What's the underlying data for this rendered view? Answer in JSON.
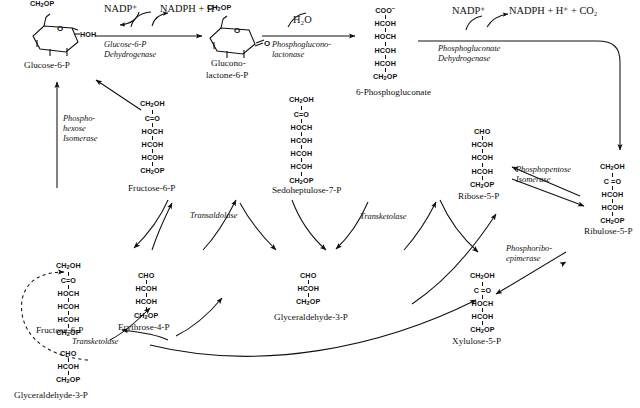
{
  "diagram": {
    "type": "biochemical-pathway"
  },
  "metabolites": [
    {
      "id": "glucose-6-p",
      "name": "Glucose-6-P",
      "form": "ring",
      "labels": [
        "CH2OP",
        "O",
        "HOH"
      ]
    },
    {
      "id": "glucono-lactone-6-p",
      "name_line1": "Glucono-",
      "name_line2": "lactone-6-P",
      "form": "ring",
      "labels": [
        "CH2OP",
        "O",
        "O"
      ]
    },
    {
      "id": "6-phosphogluconate",
      "name": "6-Phosphogluconate",
      "form": "chain",
      "rows": [
        "COO⁻",
        "HCOH",
        "HOCH",
        "HCOH",
        "HCOH",
        "CH2OP"
      ]
    },
    {
      "id": "fructose-6-p-top",
      "name": "Fructose-6-P",
      "form": "chain",
      "rows": [
        "CH2OH",
        "C=O",
        "HOCH",
        "HCOH",
        "HCOH",
        "CH2OP"
      ]
    },
    {
      "id": "sedoheptulose-7-p",
      "name": "Sedoheptulose-7-P",
      "form": "chain",
      "rows": [
        "CH2OH",
        "C=O",
        "HOCH",
        "HCOH",
        "HCOH",
        "HCOH",
        "CH2OP"
      ]
    },
    {
      "id": "ribose-5-p",
      "name": "Ribose-5-P",
      "form": "chain",
      "rows": [
        "CHO",
        "HCOH",
        "HCOH",
        "HCOH",
        "CH2OP"
      ]
    },
    {
      "id": "ribulose-5-p",
      "name": "Ribulose-5-P",
      "form": "chain",
      "rows": [
        "CH2OH",
        "C =O",
        "HCOH",
        "HCOH",
        "CH2OP"
      ]
    },
    {
      "id": "fructose-6-p-bottom",
      "name": "Fructose-6-P",
      "form": "chain",
      "rows": [
        "CH2OH",
        "C=O",
        "HOCH",
        "HCOH",
        "HCOH",
        "CH2OP"
      ]
    },
    {
      "id": "erythrose-4-p",
      "name": "Erythrose-4-P",
      "form": "chain",
      "rows": [
        "CHO",
        "HCOH",
        "HCOH",
        "CH2OP"
      ]
    },
    {
      "id": "glyceraldehyde-3-p-mid",
      "name": "Glyceraldehyde-3-P",
      "form": "chain",
      "rows": [
        "CHO",
        "HCOH",
        "CH2OP"
      ]
    },
    {
      "id": "xylulose-5-p",
      "name": "Xylulose-5-P",
      "form": "chain",
      "rows": [
        "CH2OH",
        "C =O",
        "HOCH",
        "HCOH",
        "CH2OP"
      ]
    },
    {
      "id": "glyceraldehyde-3-p-bottom",
      "name": "Glyceraldehyde-3-P",
      "form": "chain",
      "rows": [
        "CHO",
        "HCOH",
        "CH2OP"
      ]
    }
  ],
  "enzymes": [
    {
      "id": "g6pdh",
      "line1": "Glucose-6-P",
      "line2": "Dehydrogenase"
    },
    {
      "id": "pgl",
      "line1": "Phosphoglucono-",
      "line2": "lactonase"
    },
    {
      "id": "6pgdh",
      "line1": "Phosphogluconate",
      "line2": "Dehydrogenase"
    },
    {
      "id": "phi",
      "line1": "Phospho-",
      "line2": "hexose",
      "line3": "Isomerase"
    },
    {
      "id": "ppi",
      "line1": "Phosphopentose",
      "line2": "Isomerase"
    },
    {
      "id": "pre",
      "line1": "Phosphoribo-",
      "line2": "epimerase"
    },
    {
      "id": "tal",
      "line1": "Transaldolase",
      "line2": ""
    },
    {
      "id": "tkt1",
      "line1": "Transketolase",
      "line2": ""
    },
    {
      "id": "tkt2",
      "line1": "Transketolase",
      "line2": ""
    }
  ],
  "cofactors": [
    {
      "id": "nadp-1",
      "text": "NADP⁺"
    },
    {
      "id": "nadph-1",
      "text": "NADPH + H⁺"
    },
    {
      "id": "water",
      "text": "H₂O"
    },
    {
      "id": "nadp-2",
      "text": "NADP⁺"
    },
    {
      "id": "nadph-2",
      "text": "NADPH + H⁺ + CO₂"
    }
  ],
  "colors": {
    "ink": "#111111",
    "background": "#ffffff"
  }
}
